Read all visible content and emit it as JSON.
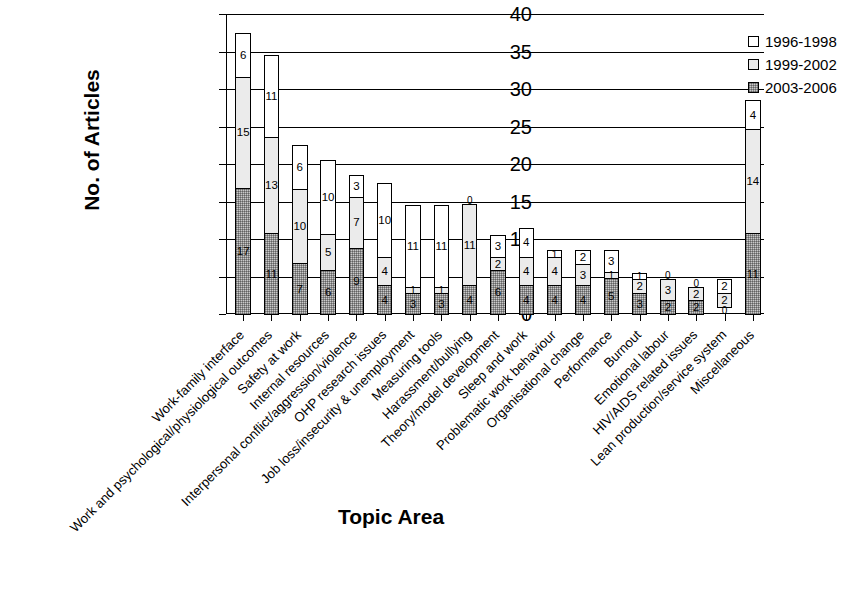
{
  "chart_data": {
    "type": "bar",
    "subtype": "stacked-vertical",
    "title": "",
    "xlabel": "Topic Area",
    "ylabel": "No. of Articles",
    "ylim": [
      0,
      40
    ],
    "yticks": [
      0,
      5,
      10,
      15,
      20,
      25,
      30,
      35,
      40
    ],
    "grid": true,
    "legend_position": "top-right",
    "legend": [
      "1996-1998",
      "1999-2002",
      "2003-2006"
    ],
    "series_styles": [
      {
        "name": "1996-1998",
        "fill": "#ffffff",
        "pattern": "none",
        "border": "#000000"
      },
      {
        "name": "1999-2002",
        "fill": "#ebebeb",
        "pattern": "none",
        "border": "#000000"
      },
      {
        "name": "2003-2006",
        "fill": "#c9c9c9",
        "pattern": "dotted-grid",
        "border": "#000000"
      }
    ],
    "categories": [
      "Work-family interface",
      "Work and psychological/physiological outcomes",
      "Safety at work",
      "Internal resources",
      "Interpersonal conflict/aggression/violence",
      "OHP research issues",
      "Job loss/insecurity & unemployment",
      "Measuring tools",
      "Harassment/bullying",
      "Theory/model development",
      "Sleep and work",
      "Problematic work behaviour",
      "Organisational change",
      "Performance",
      "Burnout",
      "Emotional labour",
      "HIV/AIDS related issues",
      "Lean production/service system",
      "Miscellaneous"
    ],
    "series": [
      {
        "name": "1996-1998",
        "values": [
          6,
          11,
          6,
          10,
          3,
          10,
          11,
          11,
          0,
          3,
          4,
          1,
          2,
          3,
          1,
          0,
          0,
          2,
          4
        ]
      },
      {
        "name": "1999-2002",
        "values": [
          15,
          13,
          10,
          5,
          7,
          4,
          1,
          1,
          11,
          2,
          4,
          4,
          3,
          1,
          2,
          3,
          2,
          2,
          14
        ]
      },
      {
        "name": "2003-2006",
        "values": [
          17,
          11,
          7,
          6,
          9,
          4,
          3,
          3,
          4,
          6,
          4,
          4,
          4,
          5,
          3,
          2,
          2,
          0,
          11
        ]
      }
    ],
    "totals": [
      38,
      35,
      23,
      21,
      19,
      18,
      15,
      15,
      15,
      11,
      12,
      9,
      9,
      9,
      6,
      5,
      4,
      4,
      29
    ]
  },
  "ytick_labels": [
    "0",
    "5",
    "10",
    "15",
    "20",
    "25",
    "30",
    "35",
    "40"
  ],
  "legend_labels": [
    "1996-1998",
    "1999-2002",
    "2003-2006"
  ],
  "axis_titles": {
    "y": "No. of Articles",
    "x": "Topic Area"
  }
}
